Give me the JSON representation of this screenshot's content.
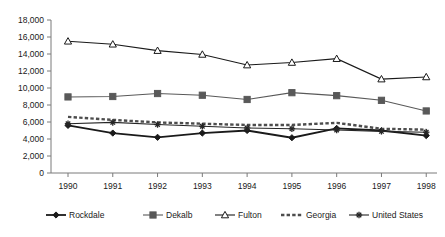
{
  "chart_data": {
    "type": "line",
    "title": "",
    "subtitle": "",
    "xlabel": "",
    "ylabel": "",
    "categories": [
      "1990",
      "1991",
      "1992",
      "1993",
      "1994",
      "1995",
      "1996",
      "1997",
      "1998"
    ],
    "x": [
      1990,
      1991,
      1992,
      1993,
      1994,
      1995,
      1996,
      1997,
      1998
    ],
    "ylim": [
      0,
      18000
    ],
    "ytick_values": [
      0,
      2000,
      4000,
      6000,
      8000,
      10000,
      12000,
      14000,
      16000,
      18000
    ],
    "ytick_labels": [
      "0",
      "2,000",
      "4,000",
      "6,000",
      "8,000",
      "10,000",
      "12,000",
      "14,000",
      "16,000",
      "18,000"
    ],
    "grid": false,
    "legend_position": "bottom",
    "series": [
      {
        "name": "Rockdale",
        "marker": "diamond",
        "line_style": "solid",
        "color": "#1a1a1a",
        "line_width": 1.8,
        "values": [
          5600,
          4700,
          4200,
          4700,
          5000,
          4150,
          5250,
          5000,
          4400
        ]
      },
      {
        "name": "Dekalb",
        "marker": "square",
        "line_style": "solid",
        "color": "#595959",
        "line_width": 1.1,
        "values": [
          8950,
          9000,
          9350,
          9150,
          8650,
          9450,
          9100,
          8550,
          7300
        ]
      },
      {
        "name": "Fulton",
        "marker": "triangle",
        "line_style": "solid",
        "color": "#1a1a1a",
        "line_width": 1.1,
        "values": [
          15500,
          15150,
          14400,
          13950,
          12700,
          13000,
          13450,
          11050,
          11300
        ]
      },
      {
        "name": "Georgia",
        "marker": "none",
        "line_style": "dashed",
        "color": "#4d4d4d",
        "line_width": 2.4,
        "values": [
          6600,
          6250,
          5950,
          5800,
          5650,
          5650,
          5900,
          5200,
          5100
        ]
      },
      {
        "name": "United States",
        "marker": "star",
        "line_style": "solid",
        "color": "#262626",
        "line_width": 1.1,
        "values": [
          5800,
          5950,
          5700,
          5500,
          5300,
          5200,
          5050,
          4900,
          4800
        ]
      }
    ]
  },
  "legend": {
    "items": [
      {
        "label": "Rockdale"
      },
      {
        "label": "Dekalb"
      },
      {
        "label": "Fulton"
      },
      {
        "label": "Georgia"
      },
      {
        "label": "United States"
      }
    ]
  }
}
